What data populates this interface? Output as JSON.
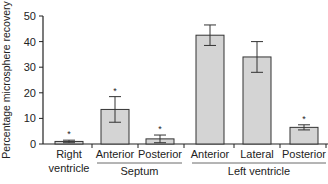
{
  "chart_data": {
    "type": "bar",
    "title": "",
    "xlabel": "",
    "ylabel": "Percentage microsphere recovery",
    "ylim": [
      0,
      50
    ],
    "yticks": [
      0,
      10,
      20,
      30,
      40,
      50
    ],
    "grid": false,
    "legend": null,
    "categories": [
      "Right ventricle",
      "Septum Anterior",
      "Septum Posterior",
      "Left ventricle Anterior",
      "Left ventricle Lateral",
      "Left ventricle Posterior"
    ],
    "category_labels": [
      "Right",
      "Anterior",
      "Posterior",
      "Anterior",
      "Lateral",
      "Posterior"
    ],
    "category_labels_line2": [
      "ventricle",
      "",
      "",
      "",
      "",
      ""
    ],
    "groups": [
      {
        "label": "Septum",
        "members": [
          1,
          2
        ]
      },
      {
        "label": "Left ventricle",
        "members": [
          3,
          4,
          5
        ]
      }
    ],
    "values": [
      1,
      13.5,
      2,
      42.5,
      34,
      6.5
    ],
    "errors": [
      0.5,
      5,
      1.5,
      4,
      6,
      1
    ],
    "significance": [
      true,
      true,
      true,
      false,
      false,
      true
    ],
    "significance_marker": "*",
    "bar_color": "#d4d4d4"
  }
}
